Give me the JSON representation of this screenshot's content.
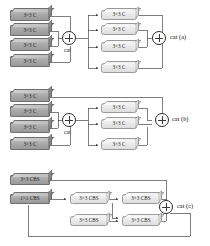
{
  "figure": {
    "type": "neural-network-block-diagram",
    "panels": [
      {
        "id": "a",
        "caption": "cat  (a)",
        "merge_label": "cat",
        "input_blocks": [
          {
            "label": "3×3 C"
          },
          {
            "label": "3×3 C"
          },
          {
            "label": "3×3 C"
          },
          {
            "label": "3×3 C"
          }
        ],
        "output_blocks": [
          {
            "label": "3×3 C"
          },
          {
            "label": "3×3 C"
          },
          {
            "label": "3×3 C"
          },
          {
            "label": "3×3 C"
          }
        ]
      },
      {
        "id": "b",
        "caption": "cat  (b)",
        "merge_label": "cat",
        "input_blocks": [
          {
            "label": "3×3 C"
          },
          {
            "label": "3×3 C"
          },
          {
            "label": "3×3 C"
          },
          {
            "label": "3×3 C"
          }
        ],
        "output_blocks": [
          {
            "label": "3×3 C"
          },
          {
            "label": "3×3 C"
          },
          {
            "label": "3×3 C"
          }
        ]
      },
      {
        "id": "c",
        "caption": "cat  (c)",
        "input_blocks": [
          {
            "label": "3×3 CBS"
          },
          {
            "label": "1×1 CBS"
          }
        ],
        "chain_top": [
          {
            "label": "3×3 CBS"
          },
          {
            "label": "3×3 CBS"
          }
        ],
        "chain_bottom": [
          {
            "label": "3×3 CBS"
          },
          {
            "label": "3×3 CBS"
          }
        ]
      }
    ],
    "colors": {
      "dark_block": "#a7a7a7",
      "light_block": "#e8e8e8",
      "wire": "#3a3a3a",
      "text": "#111111"
    }
  }
}
